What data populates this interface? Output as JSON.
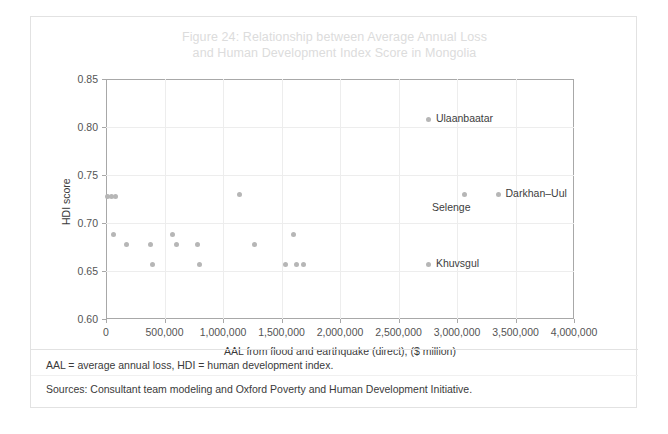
{
  "figure": {
    "title_line1": "Figure 24: Relationship between Average Annual Loss",
    "title_line2": "and Human Development Index Score in Mongolia",
    "title_color": "#dcdcdc",
    "point_color": "#b6b6b6",
    "frame_color": "#e2e2e2"
  },
  "footnotes": {
    "abbreviations": "AAL = average annual loss, HDI = human development index.",
    "sources": "Sources: Consultant team modeling and Oxford Poverty and Human Development Initiative."
  },
  "chart_data": {
    "type": "scatter",
    "title": "Figure 24: Relationship between Average Annual Loss and Human Development Index Score in Mongolia",
    "xlabel": "AAL from flood and earthquake (direct), ($ million)",
    "ylabel": "HDI score",
    "xlim": [
      0,
      4000000
    ],
    "ylim": [
      0.6,
      0.85
    ],
    "xticks": [
      0,
      500000,
      1000000,
      1500000,
      2000000,
      2500000,
      3000000,
      3500000,
      4000000
    ],
    "xtick_labels": [
      "0",
      "500,000",
      "1,000,000",
      "1,500,000",
      "2,000,000",
      "2,500,000",
      "3,000,000",
      "3,500,000",
      "4,000,000"
    ],
    "yticks": [
      0.6,
      0.65,
      0.7,
      0.75,
      0.8,
      0.85
    ],
    "ytick_labels": [
      "0.60",
      "0.65",
      "0.70",
      "0.75",
      "0.80",
      "0.85"
    ],
    "grid": true,
    "legend": "none",
    "series": [
      {
        "name": "Mongolian provinces",
        "marker": "circle",
        "color": "#b6b6b6",
        "points": [
          {
            "x": 10000,
            "y": 0.728,
            "label": ""
          },
          {
            "x": 45000,
            "y": 0.728,
            "label": ""
          },
          {
            "x": 80000,
            "y": 0.728,
            "label": ""
          },
          {
            "x": 60000,
            "y": 0.688,
            "label": ""
          },
          {
            "x": 175000,
            "y": 0.678,
            "label": ""
          },
          {
            "x": 380000,
            "y": 0.678,
            "label": ""
          },
          {
            "x": 395000,
            "y": 0.657,
            "label": ""
          },
          {
            "x": 565000,
            "y": 0.688,
            "label": ""
          },
          {
            "x": 600000,
            "y": 0.678,
            "label": ""
          },
          {
            "x": 780000,
            "y": 0.678,
            "label": ""
          },
          {
            "x": 800000,
            "y": 0.657,
            "label": ""
          },
          {
            "x": 1140000,
            "y": 0.73,
            "label": ""
          },
          {
            "x": 1265000,
            "y": 0.678,
            "label": ""
          },
          {
            "x": 1530000,
            "y": 0.657,
            "label": ""
          },
          {
            "x": 1600000,
            "y": 0.688,
            "label": ""
          },
          {
            "x": 1625000,
            "y": 0.657,
            "label": ""
          },
          {
            "x": 1690000,
            "y": 0.657,
            "label": ""
          },
          {
            "x": 2760000,
            "y": 0.808,
            "label": "Ulaanbaatar"
          },
          {
            "x": 2760000,
            "y": 0.657,
            "label": "Khuvsgul"
          },
          {
            "x": 3060000,
            "y": 0.73,
            "label": "Selenge"
          },
          {
            "x": 3355000,
            "y": 0.73,
            "label": "Darkhan–Uul"
          }
        ]
      }
    ],
    "annotations": [
      {
        "text": "Ulaanbaatar",
        "x": 2760000,
        "y": 0.808,
        "position": "right"
      },
      {
        "text": "Khuvsgul",
        "x": 2760000,
        "y": 0.657,
        "position": "right"
      },
      {
        "text": "Selenge",
        "x": 3060000,
        "y": 0.73,
        "position": "below"
      },
      {
        "text": "Darkhan–Uul",
        "x": 3355000,
        "y": 0.73,
        "position": "right"
      }
    ]
  }
}
